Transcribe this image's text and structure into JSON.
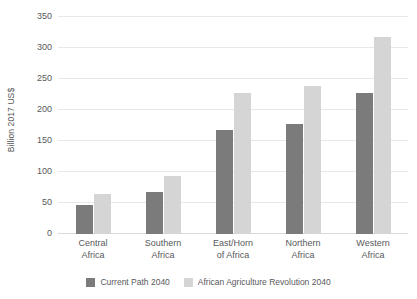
{
  "chart_data": {
    "type": "bar",
    "title": "",
    "xlabel": "",
    "ylabel": "Billion 2017 US$",
    "ylim": [
      0,
      350
    ],
    "ytick_step": 50,
    "yticks": [
      0,
      50,
      100,
      150,
      200,
      250,
      300,
      350
    ],
    "ytick_labels": [
      "0",
      "50",
      "100",
      "150",
      "200",
      "250",
      "300",
      "350"
    ],
    "grid": true,
    "legend_position": "bottom",
    "categories": [
      "Central Africa",
      "Southern Africa",
      "East/Horn of Africa",
      "Northern Africa",
      "Western Africa"
    ],
    "category_lines": [
      [
        "Central",
        "Africa"
      ],
      [
        "Southern",
        "Africa"
      ],
      [
        "East/Horn",
        "of Africa"
      ],
      [
        "Northern",
        "Africa"
      ],
      [
        "Western",
        "Africa"
      ]
    ],
    "series": [
      {
        "name": "Current Path 2040",
        "color": "#7b7b7b",
        "values": [
          46,
          68,
          167,
          177,
          228
        ]
      },
      {
        "name": "African Agriculture Revolution 2040",
        "color": "#d5d5d5",
        "values": [
          65,
          94,
          228,
          239,
          317
        ]
      }
    ]
  },
  "colors": {
    "series_dark": "#7b7b7b",
    "series_light": "#d5d5d5",
    "text": "#58595b",
    "gridline": "#e8e8e8",
    "background": "#ffffff"
  }
}
